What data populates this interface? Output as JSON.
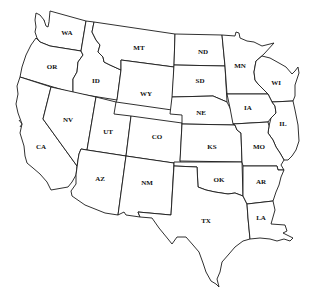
{
  "map": {
    "title": "Western and Central United States",
    "background": "#ffffff",
    "stroke_color": "#1a1a1a",
    "fill_color": "#ffffff",
    "states": [
      {
        "abbr": "WA",
        "x": 67,
        "y": 33
      },
      {
        "abbr": "OR",
        "x": 52,
        "y": 67
      },
      {
        "abbr": "ID",
        "x": 96,
        "y": 81
      },
      {
        "abbr": "MT",
        "x": 139,
        "y": 48
      },
      {
        "abbr": "WY",
        "x": 146,
        "y": 94
      },
      {
        "abbr": "NV",
        "x": 68,
        "y": 120
      },
      {
        "abbr": "UT",
        "x": 108,
        "y": 132
      },
      {
        "abbr": "CO",
        "x": 157,
        "y": 137
      },
      {
        "abbr": "CA",
        "x": 41,
        "y": 147
      },
      {
        "abbr": "AZ",
        "x": 100,
        "y": 179
      },
      {
        "abbr": "NM",
        "x": 147,
        "y": 183
      },
      {
        "abbr": "ND",
        "x": 203,
        "y": 52
      },
      {
        "abbr": "SD",
        "x": 200,
        "y": 81
      },
      {
        "abbr": "NE",
        "x": 201,
        "y": 113
      },
      {
        "abbr": "KS",
        "x": 212,
        "y": 147
      },
      {
        "abbr": "OK",
        "x": 219,
        "y": 180
      },
      {
        "abbr": "TX",
        "x": 206,
        "y": 221
      },
      {
        "abbr": "MN",
        "x": 240,
        "y": 66
      },
      {
        "abbr": "WI",
        "x": 276,
        "y": 83
      },
      {
        "abbr": "IA",
        "x": 248,
        "y": 108
      },
      {
        "abbr": "IL",
        "x": 283,
        "y": 124
      },
      {
        "abbr": "MO",
        "x": 259,
        "y": 147
      },
      {
        "abbr": "AR",
        "x": 261,
        "y": 182
      },
      {
        "abbr": "LA",
        "x": 261,
        "y": 218
      }
    ]
  }
}
